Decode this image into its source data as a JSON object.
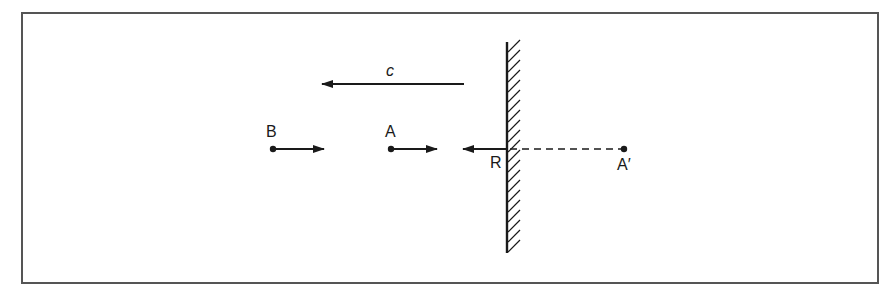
{
  "diagram": {
    "type": "physics-mirror-reflection",
    "colors": {
      "ink": "#1a1a1a",
      "frame": "#555555",
      "background": "#ffffff"
    },
    "frame": {
      "x": 22,
      "y": 13,
      "width": 856,
      "height": 270
    },
    "mirror": {
      "x": 507,
      "y_top": 42,
      "y_bottom": 253,
      "hatch_side": "right"
    },
    "labels": {
      "c": "c",
      "B": "B",
      "A": "A",
      "R": "R",
      "A_prime": "A′"
    },
    "points": [
      {
        "id": "B",
        "label": "B",
        "x": 273,
        "y": 149,
        "arrow_to_x": 324,
        "direction": "right"
      },
      {
        "id": "A",
        "label": "A",
        "x": 391,
        "y": 149,
        "arrow_to_x": 437,
        "direction": "right"
      },
      {
        "id": "A_prime",
        "label": "A′",
        "x": 624,
        "y": 149
      }
    ],
    "arrows": [
      {
        "id": "c-arrow",
        "label": "c",
        "from_x": 464,
        "to_x": 322,
        "y": 84,
        "direction": "left"
      },
      {
        "id": "R-arrow",
        "label": "R",
        "from_x": 507,
        "to_x": 463,
        "y": 149,
        "direction": "left"
      }
    ],
    "dashed_line": {
      "from_x": 507,
      "to_x": 624,
      "y": 149
    }
  }
}
